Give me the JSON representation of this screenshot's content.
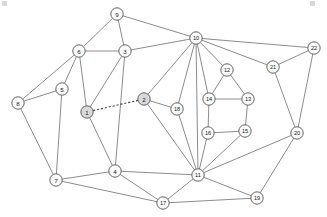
{
  "figure": {
    "width": 327,
    "height": 217,
    "background_color": "#ffffff",
    "node_fill_color": "#fbfbfb",
    "node_shaded_fill_color": "#d9d9d9",
    "node_stroke_color": "#555555",
    "edge_color": "#6e6e6e",
    "dashed_edge_color": "#4a4a4a"
  },
  "chart_data": {
    "type": "graph",
    "title": "",
    "xlabel": "",
    "ylabel": "",
    "directed": false,
    "node_count": 22,
    "edge_count": 47,
    "nodes": [
      {
        "id": "1",
        "label": "1",
        "x": 87,
        "y": 112,
        "shaded": true
      },
      {
        "id": "2",
        "label": "2",
        "x": 144,
        "y": 99,
        "shaded": true
      },
      {
        "id": "3",
        "label": "3",
        "x": 125,
        "y": 51,
        "shaded": false
      },
      {
        "id": "4",
        "label": "4",
        "x": 115,
        "y": 171,
        "shaded": false
      },
      {
        "id": "5",
        "label": "5",
        "x": 62,
        "y": 89,
        "shaded": false
      },
      {
        "id": "6",
        "label": "6",
        "x": 79,
        "y": 51,
        "shaded": false
      },
      {
        "id": "7",
        "label": "7",
        "x": 56,
        "y": 180,
        "shaded": false
      },
      {
        "id": "8",
        "label": "8",
        "x": 18,
        "y": 103,
        "shaded": false
      },
      {
        "id": "9",
        "label": "9",
        "x": 117,
        "y": 14,
        "shaded": false
      },
      {
        "id": "10",
        "label": "10",
        "x": 196,
        "y": 38,
        "shaded": false
      },
      {
        "id": "11",
        "label": "11",
        "x": 198,
        "y": 175,
        "shaded": false
      },
      {
        "id": "12",
        "label": "12",
        "x": 227,
        "y": 70,
        "shaded": false
      },
      {
        "id": "13",
        "label": "13",
        "x": 248,
        "y": 99,
        "shaded": false
      },
      {
        "id": "14",
        "label": "14",
        "x": 209,
        "y": 99,
        "shaded": false
      },
      {
        "id": "15",
        "label": "15",
        "x": 245,
        "y": 131,
        "shaded": false
      },
      {
        "id": "16",
        "label": "16",
        "x": 208,
        "y": 133,
        "shaded": false
      },
      {
        "id": "17",
        "label": "17",
        "x": 163,
        "y": 203,
        "shaded": false
      },
      {
        "id": "18",
        "label": "18",
        "x": 177,
        "y": 109,
        "shaded": false
      },
      {
        "id": "19",
        "label": "19",
        "x": 257,
        "y": 198,
        "shaded": false
      },
      {
        "id": "20",
        "label": "20",
        "x": 297,
        "y": 133,
        "shaded": false
      },
      {
        "id": "21",
        "label": "21",
        "x": 273,
        "y": 67,
        "shaded": false
      },
      {
        "id": "22",
        "label": "22",
        "x": 314,
        "y": 48,
        "shaded": false
      }
    ],
    "edges": [
      {
        "source": "9",
        "target": "6",
        "style": "solid"
      },
      {
        "source": "9",
        "target": "3",
        "style": "solid"
      },
      {
        "source": "9",
        "target": "10",
        "style": "solid"
      },
      {
        "source": "6",
        "target": "3",
        "style": "solid"
      },
      {
        "source": "6",
        "target": "5",
        "style": "solid"
      },
      {
        "source": "6",
        "target": "8",
        "style": "solid"
      },
      {
        "source": "6",
        "target": "1",
        "style": "solid"
      },
      {
        "source": "3",
        "target": "10",
        "style": "solid"
      },
      {
        "source": "3",
        "target": "1",
        "style": "solid"
      },
      {
        "source": "3",
        "target": "4",
        "style": "solid"
      },
      {
        "source": "5",
        "target": "8",
        "style": "solid"
      },
      {
        "source": "5",
        "target": "7",
        "style": "solid"
      },
      {
        "source": "8",
        "target": "7",
        "style": "solid"
      },
      {
        "source": "1",
        "target": "2",
        "style": "dashed"
      },
      {
        "source": "1",
        "target": "4",
        "style": "solid"
      },
      {
        "source": "7",
        "target": "4",
        "style": "solid"
      },
      {
        "source": "7",
        "target": "17",
        "style": "solid"
      },
      {
        "source": "4",
        "target": "11",
        "style": "solid"
      },
      {
        "source": "4",
        "target": "17",
        "style": "solid"
      },
      {
        "source": "2",
        "target": "10",
        "style": "solid"
      },
      {
        "source": "2",
        "target": "18",
        "style": "solid"
      },
      {
        "source": "2",
        "target": "11",
        "style": "solid"
      },
      {
        "source": "10",
        "target": "18",
        "style": "solid"
      },
      {
        "source": "10",
        "target": "11",
        "style": "solid"
      },
      {
        "source": "10",
        "target": "14",
        "style": "solid"
      },
      {
        "source": "10",
        "target": "12",
        "style": "solid"
      },
      {
        "source": "10",
        "target": "21",
        "style": "solid"
      },
      {
        "source": "10",
        "target": "22",
        "style": "solid"
      },
      {
        "source": "18",
        "target": "11",
        "style": "solid"
      },
      {
        "source": "12",
        "target": "14",
        "style": "solid"
      },
      {
        "source": "12",
        "target": "13",
        "style": "solid"
      },
      {
        "source": "14",
        "target": "13",
        "style": "solid"
      },
      {
        "source": "14",
        "target": "16",
        "style": "solid"
      },
      {
        "source": "13",
        "target": "15",
        "style": "solid"
      },
      {
        "source": "16",
        "target": "15",
        "style": "solid"
      },
      {
        "source": "16",
        "target": "11",
        "style": "solid"
      },
      {
        "source": "15",
        "target": "11",
        "style": "solid"
      },
      {
        "source": "11",
        "target": "17",
        "style": "solid"
      },
      {
        "source": "11",
        "target": "19",
        "style": "solid"
      },
      {
        "source": "11",
        "target": "20",
        "style": "solid"
      },
      {
        "source": "17",
        "target": "19",
        "style": "solid"
      },
      {
        "source": "19",
        "target": "20",
        "style": "solid"
      },
      {
        "source": "20",
        "target": "21",
        "style": "solid"
      },
      {
        "source": "20",
        "target": "22",
        "style": "solid"
      },
      {
        "source": "21",
        "target": "22",
        "style": "solid"
      }
    ],
    "node_radius": 6.2
  }
}
